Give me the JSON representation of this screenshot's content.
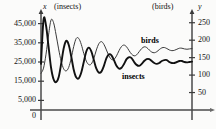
{
  "chart_data": {
    "type": "line",
    "title": "",
    "xlabel": "",
    "grid": false,
    "legend_position": "inline-annotations",
    "axes": {
      "left": {
        "symbol": "x",
        "unit_label": "(insects)",
        "ticks": [
          "45,000",
          "35,000",
          "25,000",
          "15,000",
          "5,000"
        ],
        "tick_values": [
          45000,
          35000,
          25000,
          15000,
          5000
        ],
        "origin_label": "0",
        "ylim": [
          0,
          50000
        ]
      },
      "right": {
        "symbol": "y",
        "unit_label": "(birds)",
        "ticks": [
          "250",
          "200",
          "150",
          "100",
          "50"
        ],
        "tick_values": [
          250,
          200,
          150,
          100,
          50
        ],
        "ylim": [
          0,
          275
        ]
      }
    },
    "series": [
      {
        "name": "insects",
        "annotation": "insects",
        "axis": "left",
        "style": "bold",
        "color": "#111111",
        "equilibrium": 25000,
        "points": [
          [
            0,
            24000
          ],
          [
            1,
            47000
          ],
          [
            2,
            44000
          ],
          [
            3,
            33000
          ],
          [
            4,
            22000
          ],
          [
            5,
            16000
          ],
          [
            6,
            14500
          ],
          [
            7,
            17000
          ],
          [
            8,
            24000
          ],
          [
            9,
            32000
          ],
          [
            10,
            36000
          ],
          [
            11,
            34000
          ],
          [
            12,
            28000
          ],
          [
            13,
            21000
          ],
          [
            14,
            17000
          ],
          [
            15,
            16500
          ],
          [
            16,
            19500
          ],
          [
            17,
            25000
          ],
          [
            18,
            30500
          ],
          [
            19,
            32500
          ],
          [
            20,
            30500
          ],
          [
            21,
            26000
          ],
          [
            22,
            21500
          ],
          [
            23,
            19500
          ],
          [
            24,
            20000
          ],
          [
            25,
            23000
          ],
          [
            26,
            27000
          ],
          [
            27,
            29000
          ],
          [
            28,
            28500
          ],
          [
            29,
            26000
          ],
          [
            30,
            23000
          ],
          [
            31,
            21500
          ],
          [
            32,
            22000
          ],
          [
            33,
            24000
          ],
          [
            34,
            26500
          ],
          [
            35,
            27500
          ],
          [
            36,
            27000
          ],
          [
            37,
            25000
          ],
          [
            38,
            23500
          ],
          [
            39,
            23000
          ],
          [
            40,
            24000
          ],
          [
            41,
            25500
          ],
          [
            42,
            26500
          ],
          [
            43,
            26500
          ],
          [
            44,
            25500
          ],
          [
            45,
            24500
          ],
          [
            46,
            24000
          ],
          [
            47,
            24500
          ],
          [
            48,
            25500
          ],
          [
            49,
            26000
          ],
          [
            50,
            26000
          ],
          [
            51,
            25000
          ],
          [
            52,
            24500
          ],
          [
            53,
            24500
          ],
          [
            54,
            25000
          ],
          [
            55,
            25500
          ],
          [
            56,
            25500
          ],
          [
            57,
            25000
          ],
          [
            58,
            24800
          ],
          [
            59,
            25000
          ],
          [
            60,
            25200
          ]
        ]
      },
      {
        "name": "birds",
        "annotation": "birds",
        "axis": "right",
        "style": "thin",
        "color": "#3a3a3a",
        "equilibrium": 175,
        "points": [
          [
            0,
            105
          ],
          [
            1,
            120
          ],
          [
            2,
            160
          ],
          [
            3,
            215
          ],
          [
            4,
            258
          ],
          [
            5,
            250
          ],
          [
            6,
            215
          ],
          [
            7,
            175
          ],
          [
            8,
            140
          ],
          [
            9,
            118
          ],
          [
            10,
            112
          ],
          [
            11,
            122
          ],
          [
            12,
            148
          ],
          [
            13,
            182
          ],
          [
            14,
            205
          ],
          [
            15,
            205
          ],
          [
            16,
            188
          ],
          [
            17,
            162
          ],
          [
            18,
            140
          ],
          [
            19,
            130
          ],
          [
            20,
            132
          ],
          [
            21,
            148
          ],
          [
            22,
            172
          ],
          [
            23,
            190
          ],
          [
            24,
            196
          ],
          [
            25,
            188
          ],
          [
            26,
            172
          ],
          [
            27,
            155
          ],
          [
            28,
            145
          ],
          [
            29,
            145
          ],
          [
            30,
            155
          ],
          [
            31,
            170
          ],
          [
            32,
            182
          ],
          [
            33,
            186
          ],
          [
            34,
            181
          ],
          [
            35,
            170
          ],
          [
            36,
            160
          ],
          [
            37,
            155
          ],
          [
            38,
            158
          ],
          [
            39,
            167
          ],
          [
            40,
            176
          ],
          [
            41,
            181
          ],
          [
            42,
            179
          ],
          [
            43,
            172
          ],
          [
            44,
            166
          ],
          [
            45,
            164
          ],
          [
            46,
            167
          ],
          [
            47,
            173
          ],
          [
            48,
            178
          ],
          [
            49,
            179
          ],
          [
            50,
            176
          ],
          [
            51,
            172
          ],
          [
            52,
            170
          ],
          [
            53,
            171
          ],
          [
            54,
            174
          ],
          [
            55,
            177
          ],
          [
            56,
            177
          ],
          [
            57,
            175
          ],
          [
            58,
            174
          ],
          [
            59,
            175
          ],
          [
            60,
            176
          ]
        ]
      }
    ]
  },
  "labels": {
    "left_axis_symbol": "x",
    "left_axis_unit": "(insects)",
    "right_axis_symbol": "y",
    "right_axis_unit": "(birds)",
    "origin": "0",
    "insects_annotation": "insects",
    "birds_annotation": "birds",
    "left_ticks": [
      "45,000",
      "35,000",
      "25,000",
      "15,000",
      "5,000"
    ],
    "right_ticks": [
      "250",
      "200",
      "150",
      "100",
      "50"
    ]
  }
}
